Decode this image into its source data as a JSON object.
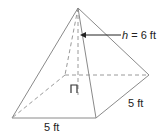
{
  "figure": {
    "type": "square pyramid",
    "labels": {
      "height_var": "h",
      "height_rest": " = 6 ft",
      "base_front": "5 ft",
      "base_side": "5 ft"
    },
    "colors": {
      "edges": "#8a8a8a",
      "text": "#222222",
      "background": "#ffffff"
    }
  }
}
